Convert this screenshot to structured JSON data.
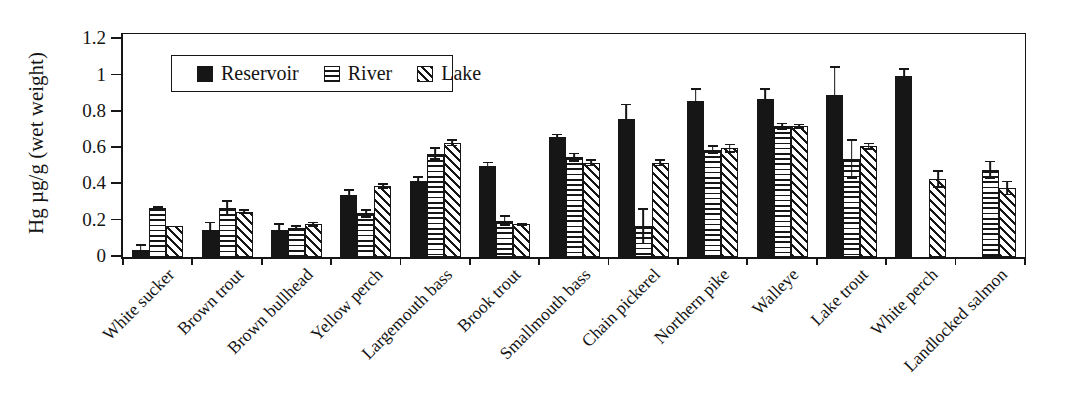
{
  "figure": {
    "background": "#ffffff",
    "ink": "#161616"
  },
  "chart_data": {
    "type": "bar",
    "title": "",
    "xlabel": "",
    "ylabel": "Hg µg/g (wet weight)",
    "ylim": [
      0,
      1.2
    ],
    "yticks": [
      0,
      0.2,
      0.4,
      0.6,
      0.8,
      1,
      1.2
    ],
    "ytick_labels": [
      "0",
      "0.2",
      "0.4",
      "0.6",
      "0.8",
      "1",
      "1.2"
    ],
    "grid": false,
    "legend_position": "top-left-inside",
    "error_bars": true,
    "categories": [
      "White sucker",
      "Brown trout",
      "Brown bullhead",
      "Yellow perch",
      "Largemouth bass",
      "Brook trout",
      "Smallmouth bass",
      "Chain pickerel",
      "Northern pike",
      "Walleye",
      "Lake trout",
      "White perch",
      "Landlocked salmon"
    ],
    "series": [
      {
        "name": "Reservoir",
        "pattern": "solid-black",
        "values": [
          0.04,
          0.15,
          0.15,
          0.34,
          0.42,
          0.5,
          0.66,
          0.76,
          0.86,
          0.87,
          0.89,
          1.0,
          null
        ],
        "errors": [
          0.03,
          0.045,
          0.035,
          0.035,
          0.025,
          0.025,
          0.02,
          0.085,
          0.07,
          0.06,
          0.16,
          0.04,
          null
        ]
      },
      {
        "name": "River",
        "pattern": "horizontal-stripes",
        "values": [
          0.27,
          0.27,
          0.16,
          0.24,
          0.57,
          0.2,
          0.55,
          0.17,
          0.59,
          0.72,
          0.54,
          null,
          0.48
        ],
        "errors": [
          0.01,
          0.045,
          0.015,
          0.025,
          0.035,
          0.03,
          0.025,
          0.1,
          0.025,
          0.02,
          0.11,
          null,
          0.05
        ]
      },
      {
        "name": "Lake",
        "pattern": "diagonal-stripes",
        "values": [
          0.17,
          0.25,
          0.18,
          0.39,
          0.63,
          0.18,
          0.52,
          0.52,
          0.6,
          0.72,
          0.61,
          0.43,
          0.38
        ],
        "errors": [
          0,
          0.015,
          0.015,
          0.015,
          0.02,
          0.01,
          0.02,
          0.02,
          0.025,
          0.015,
          0.02,
          0.05,
          0.04
        ]
      }
    ]
  }
}
